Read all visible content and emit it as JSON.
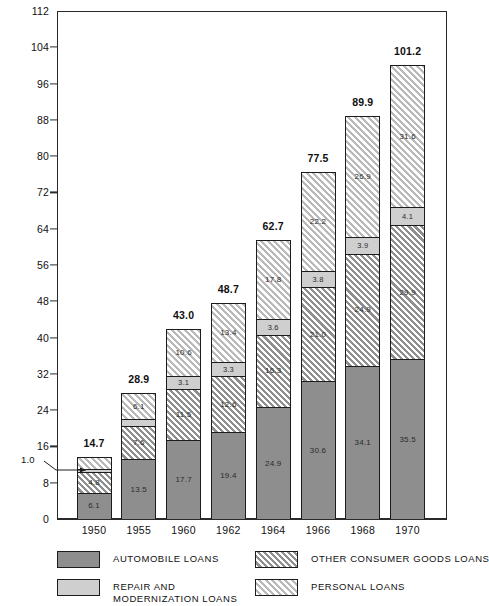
{
  "chart_data": {
    "type": "bar",
    "subtype": "stacked-bar",
    "title": "",
    "xlabel": "",
    "ylabel": "",
    "ylim": [
      0,
      112
    ],
    "ytick_step": 8,
    "yticks": [
      "0",
      "8",
      "16",
      "24",
      "32",
      "40",
      "48",
      "56",
      "64",
      "72",
      "80",
      "88",
      "96",
      "104",
      "112"
    ],
    "grid": false,
    "legend_position": "bottom",
    "categories": [
      "1950",
      "1955",
      "1960",
      "1962",
      "1964",
      "1966",
      "1968",
      "1970"
    ],
    "totals": [
      "14.7",
      "28.9",
      "43.0",
      "48.7",
      "62.7",
      "77.5",
      "89.9",
      "101.2"
    ],
    "series": [
      {
        "name": "AUTOMOBILE LOANS",
        "key": "automobile",
        "fill": "solid-medium-gray",
        "color": "#8e8e8e",
        "values": [
          6.1,
          13.5,
          17.7,
          19.4,
          24.9,
          30.6,
          34.1,
          35.5
        ],
        "labels": [
          "6.1",
          "13.5",
          "17.7",
          "19.4",
          "24.9",
          "30.6",
          "34.1",
          "35.5"
        ]
      },
      {
        "name": "OTHER CONSUMER GOODS LOANS",
        "key": "other_consumer_goods",
        "fill": "dark-diagonal-hatch",
        "color": "#b4b4b4",
        "values": [
          4.8,
          7.6,
          11.5,
          12.6,
          16.3,
          21.0,
          24.9,
          29.9
        ],
        "labels": [
          "4.8",
          "7.6",
          "11.5",
          "12.6",
          "16.3",
          "21.0",
          "24.9",
          "29.9"
        ]
      },
      {
        "name": "REPAIR AND MODERNIZATION LOANS",
        "key": "repair_modernization",
        "fill": "solid-light-gray",
        "color": "#cfcfcf",
        "values": [
          1.0,
          1.7,
          3.1,
          3.3,
          3.6,
          3.8,
          3.9,
          4.1
        ],
        "labels": [
          "1.0",
          "1.7",
          "3.1",
          "3.3",
          "3.6",
          "3.8",
          "3.9",
          "4.1"
        ]
      },
      {
        "name": "PERSONAL LOANS",
        "key": "personal",
        "fill": "light-diagonal-hatch",
        "color": "#ececec",
        "values": [
          2.8,
          6.1,
          10.6,
          13.4,
          17.8,
          22.2,
          26.9,
          31.6
        ],
        "labels": [
          "2.8",
          "6.1",
          "10.6",
          "13.4",
          "17.8",
          "22.2",
          "26.9",
          "31.6"
        ]
      }
    ],
    "annotations": [
      {
        "text": "1.0",
        "target_year": "1950",
        "target_series": "repair_modernization",
        "style": "leader-line-arrow"
      }
    ]
  },
  "legend": {
    "entries": [
      {
        "label": "AUTOMOBILE LOANS",
        "lines": [
          "AUTOMOBILE LOANS"
        ],
        "swatch": "solid-medium-gray"
      },
      {
        "label": "OTHER CONSUMER GOODS LOANS",
        "lines": [
          "OTHER CONSUMER GOODS LOANS"
        ],
        "swatch": "dark-diagonal-hatch"
      },
      {
        "label": "REPAIR AND MODERNIZATION LOANS",
        "lines": [
          "REPAIR AND",
          "MODERNIZATION LOANS"
        ],
        "swatch": "solid-light-gray"
      },
      {
        "label": "PERSONAL LOANS",
        "lines": [
          "PERSONAL LOANS"
        ],
        "swatch": "light-diagonal-hatch"
      }
    ]
  }
}
